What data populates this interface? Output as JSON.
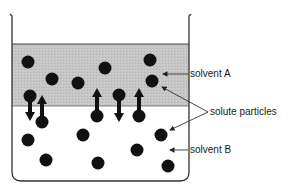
{
  "diagram": {
    "labels": {
      "solvent_a": "solvent A",
      "solute_particles": "solute particles",
      "solvent_b": "solvent B"
    },
    "colors": {
      "solvent_a_fill": "#c4c4c4",
      "solvent_b_fill": "#ffffff",
      "particle": "#111111",
      "outline": "#333333"
    },
    "particles_in_solvent_a": 8,
    "particles_in_solvent_b": 10,
    "interface_arrows": [
      {
        "x": 30,
        "direction": "down"
      },
      {
        "x": 42,
        "direction": "up"
      },
      {
        "x": 97,
        "direction": "up"
      },
      {
        "x": 119,
        "direction": "down"
      },
      {
        "x": 139,
        "direction": "up"
      }
    ]
  }
}
